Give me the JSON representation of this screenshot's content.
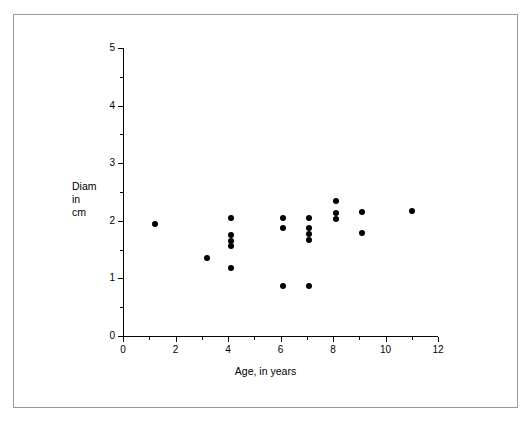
{
  "chart_data": {
    "type": "scatter",
    "title": "",
    "xlabel": "Age, in years",
    "ylabel": "Diam\nin\ncm",
    "ylabel_lines": [
      "Diam",
      "in",
      "cm"
    ],
    "xlim": [
      0,
      12
    ],
    "ylim": [
      0,
      5
    ],
    "x_major_ticks": [
      0,
      2,
      4,
      6,
      8,
      10,
      12
    ],
    "x_minor_ticks": [
      1,
      3,
      5,
      7,
      9,
      11
    ],
    "y_major_ticks": [
      0,
      1,
      2,
      3,
      4,
      5
    ],
    "y_minor_ticks": [
      0.5,
      1.5,
      2.5,
      3.5,
      4.5
    ],
    "x_tick_labels": [
      "0",
      "2",
      "4",
      "6",
      "8",
      "10",
      "12"
    ],
    "y_tick_labels": [
      "0",
      "1",
      "2",
      "3",
      "4",
      "5"
    ],
    "grid": false,
    "legend": false,
    "marker": "filled-circle",
    "marker_color": "#000000",
    "points": [
      {
        "x": 1.2,
        "y": 1.95
      },
      {
        "x": 3.2,
        "y": 1.36
      },
      {
        "x": 4.1,
        "y": 2.05
      },
      {
        "x": 4.1,
        "y": 1.75
      },
      {
        "x": 4.1,
        "y": 1.65
      },
      {
        "x": 4.1,
        "y": 1.56
      },
      {
        "x": 4.1,
        "y": 1.18
      },
      {
        "x": 6.1,
        "y": 2.05
      },
      {
        "x": 6.1,
        "y": 1.88
      },
      {
        "x": 6.1,
        "y": 0.87
      },
      {
        "x": 7.1,
        "y": 2.05
      },
      {
        "x": 7.1,
        "y": 1.88
      },
      {
        "x": 7.1,
        "y": 1.77
      },
      {
        "x": 7.1,
        "y": 1.67
      },
      {
        "x": 7.1,
        "y": 0.87
      },
      {
        "x": 8.1,
        "y": 2.34
      },
      {
        "x": 8.1,
        "y": 2.13
      },
      {
        "x": 8.1,
        "y": 2.03
      },
      {
        "x": 9.1,
        "y": 2.15
      },
      {
        "x": 9.1,
        "y": 1.78
      },
      {
        "x": 11.0,
        "y": 2.17
      }
    ]
  },
  "figure": {
    "background_color": "#ffffff",
    "frame_color": "#9a9a9a",
    "axis_color": "#000000"
  }
}
